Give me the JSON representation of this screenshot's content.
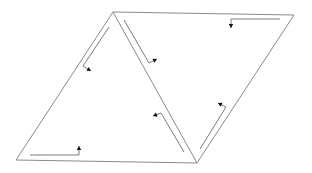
{
  "diagram": {
    "title": "",
    "colors": {
      "background": "#ffffff",
      "edge": "#8a8a8a",
      "arrow_line": "#7a7a7a",
      "arrow_head": "#111111"
    },
    "vertices": {
      "A_top_left": [
        113,
        12
      ],
      "B_top_right": [
        294,
        15
      ],
      "C_bottom_left": [
        16,
        160
      ],
      "D_bottom_mid": [
        197,
        163
      ]
    },
    "edges": [
      {
        "id": "top",
        "from": "A_top_left",
        "to": "B_top_right"
      },
      {
        "id": "left",
        "from": "A_top_left",
        "to": "C_bottom_left"
      },
      {
        "id": "bottom",
        "from": "C_bottom_left",
        "to": "D_bottom_mid"
      },
      {
        "id": "right",
        "from": "B_top_right",
        "to": "D_bottom_mid"
      },
      {
        "id": "diagonal",
        "from": "A_top_left",
        "to": "D_bottom_mid"
      }
    ],
    "triangles": [
      {
        "id": "left-triangle",
        "vertices": [
          "A_top_left",
          "C_bottom_left",
          "D_bottom_mid"
        ]
      },
      {
        "id": "right-triangle",
        "vertices": [
          "A_top_left",
          "B_top_right",
          "D_bottom_mid"
        ]
      }
    ],
    "arrows": [
      {
        "id": "arrow-left-edge",
        "points": [
          [
            109,
            27
          ],
          [
            83,
            66
          ],
          [
            91,
            71
          ]
        ],
        "head_dir": "down-right"
      },
      {
        "id": "arrow-diagonal-upper",
        "points": [
          [
            124,
            20
          ],
          [
            149,
            63
          ],
          [
            157,
            59
          ]
        ],
        "head_dir": "up-right"
      },
      {
        "id": "arrow-top-edge",
        "points": [
          [
            280,
            19
          ],
          [
            231,
            19
          ],
          [
            231,
            28
          ]
        ],
        "head_dir": "down"
      },
      {
        "id": "arrow-diagonal-lower",
        "points": [
          [
            184,
            152
          ],
          [
            161,
            113
          ],
          [
            153,
            116
          ]
        ],
        "head_dir": "left"
      },
      {
        "id": "arrow-right-edge",
        "points": [
          [
            200,
            149
          ],
          [
            226,
            107
          ],
          [
            218,
            103
          ]
        ],
        "head_dir": "up-left"
      },
      {
        "id": "arrow-bottom-edge",
        "points": [
          [
            30,
            155
          ],
          [
            79,
            155
          ],
          [
            79,
            146
          ]
        ],
        "head_dir": "up"
      }
    ]
  }
}
